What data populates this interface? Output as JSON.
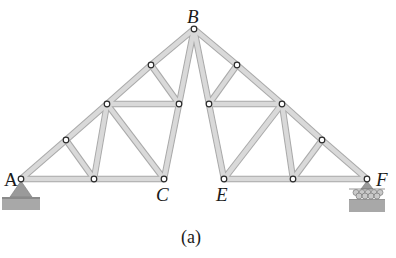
{
  "figure": {
    "caption": "(a)",
    "labels": {
      "A": "A",
      "B": "B",
      "C": "C",
      "E": "E",
      "F": "F"
    },
    "colors": {
      "member_fill": "#d9d9d9",
      "member_edge": "#a9a9a9",
      "node_fill": "#ffffff",
      "node_edge": "#2a2a2a",
      "support_fill": "#9a9a9a",
      "ground_fill": "#a6a6a6"
    },
    "nodes": {
      "A": [
        21,
        179
      ],
      "B": [
        194,
        29
      ],
      "C": [
        164,
        179
      ],
      "E": [
        224,
        179
      ],
      "F": [
        367,
        179
      ],
      "L1": [
        66,
        140
      ],
      "L2": [
        107,
        104
      ],
      "L3": [
        151,
        65
      ],
      "L4": [
        179,
        104
      ],
      "L5": [
        94,
        179
      ],
      "R1": [
        237,
        65
      ],
      "R2": [
        209,
        104
      ],
      "R3": [
        282,
        104
      ],
      "R4": [
        322,
        140
      ],
      "R5": [
        293,
        179
      ]
    },
    "members": [
      [
        "A",
        "L1"
      ],
      [
        "L1",
        "L2"
      ],
      [
        "L2",
        "L3"
      ],
      [
        "L3",
        "B"
      ],
      [
        "A",
        "L5"
      ],
      [
        "L5",
        "C"
      ],
      [
        "L1",
        "L5"
      ],
      [
        "L2",
        "L5"
      ],
      [
        "L2",
        "C"
      ],
      [
        "L2",
        "L4"
      ],
      [
        "L3",
        "L4"
      ],
      [
        "L4",
        "C"
      ],
      [
        "L4",
        "B"
      ],
      [
        "B",
        "R1"
      ],
      [
        "R1",
        "R3"
      ],
      [
        "R3",
        "R4"
      ],
      [
        "R4",
        "F"
      ],
      [
        "E",
        "R5"
      ],
      [
        "R5",
        "F"
      ],
      [
        "R1",
        "R2"
      ],
      [
        "R2",
        "R3"
      ],
      [
        "R2",
        "B"
      ],
      [
        "R2",
        "E"
      ],
      [
        "E",
        "R3"
      ],
      [
        "R3",
        "R5"
      ],
      [
        "R5",
        "R4"
      ]
    ],
    "supports": {
      "A": "pin",
      "F": "roller"
    }
  }
}
